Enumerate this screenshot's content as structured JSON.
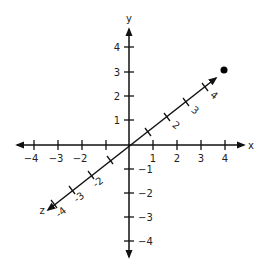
{
  "diagram": {
    "type": "3d-coordinate-axes",
    "axes": {
      "x": {
        "label": "x",
        "ticks": [
          "-4",
          "-3",
          "-2",
          "-1",
          "1",
          "2",
          "3",
          "4"
        ],
        "tick_labels": [
          "−4",
          "−3",
          "−2",
          "1",
          "2",
          "3",
          "4"
        ]
      },
      "y": {
        "label": "y",
        "tick_labels": [
          "4",
          "3",
          "2",
          "1",
          "−1",
          "−2",
          "−3",
          "−4"
        ]
      },
      "z": {
        "label": "z",
        "tick_labels_positive": [
          "2",
          "3",
          "4"
        ],
        "tick_labels_negative": [
          "-2",
          "-3",
          "-4"
        ]
      }
    },
    "point": {
      "color": "#000000"
    },
    "colors": {
      "axis": "#111111",
      "text": "#222222"
    }
  }
}
